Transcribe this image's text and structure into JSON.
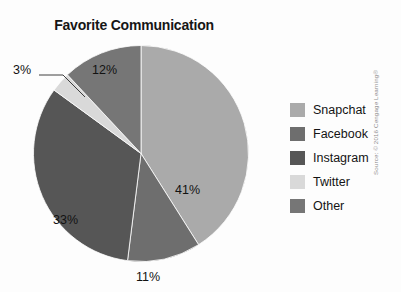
{
  "chart_data": {
    "type": "pie",
    "title": "Favorite Communication",
    "categories": [
      "Snapchat",
      "Facebook",
      "Instagram",
      "Twitter",
      "Other"
    ],
    "values": [
      41,
      11,
      33,
      3,
      12
    ],
    "value_labels": [
      "41%",
      "11%",
      "33%",
      "3%",
      "12%"
    ],
    "colors": [
      "#aaaaaa",
      "#6e6e6e",
      "#565656",
      "#d9d9d9",
      "#767676"
    ],
    "legend_position": "right",
    "start_angle_deg": 0,
    "direction": "clockwise",
    "grid": false,
    "xlabel": "",
    "ylabel": ""
  },
  "legend": {
    "items": [
      {
        "label": "Snapchat",
        "color": "#aaaaaa"
      },
      {
        "label": "Facebook",
        "color": "#6e6e6e"
      },
      {
        "label": "Instagram",
        "color": "#565656"
      },
      {
        "label": "Twitter",
        "color": "#d9d9d9"
      },
      {
        "label": "Other",
        "color": "#767676"
      }
    ]
  },
  "credit": {
    "text": "Source: © 2016 Cengage Learning®"
  }
}
